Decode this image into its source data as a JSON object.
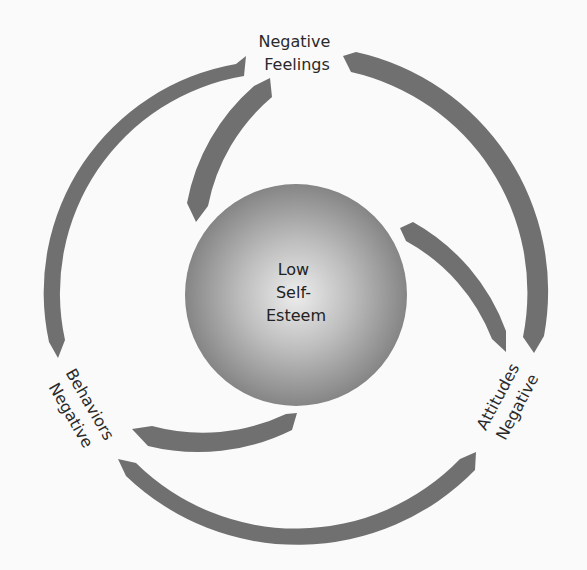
{
  "diagram": {
    "type": "cycle",
    "center": {
      "lines": [
        "Low",
        "Self-",
        "Esteem"
      ]
    },
    "nodes": [
      {
        "id": "feelings",
        "lines": [
          "Negative",
          "Feelings"
        ],
        "position": "top"
      },
      {
        "id": "attitudes",
        "lines": [
          "Attitudes",
          "Negative"
        ],
        "position": "bottom-right"
      },
      {
        "id": "behaviors",
        "lines": [
          "Behaviors",
          "Negative"
        ],
        "position": "bottom-left"
      }
    ],
    "colors": {
      "arrow": "#707070",
      "background": "#fafafa",
      "sphere_light": "#ececec",
      "sphere_dark": "#7e7e7e",
      "text": "#2a2a2a"
    }
  }
}
